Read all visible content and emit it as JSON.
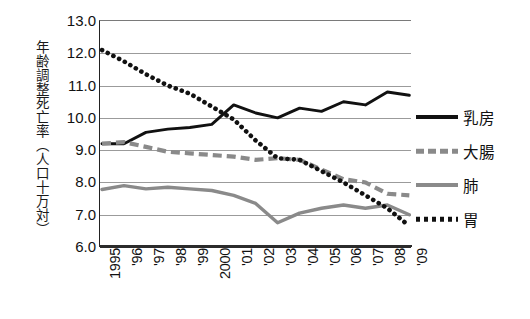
{
  "chart_data": {
    "type": "line",
    "title": "",
    "xlabel": "",
    "ylabel": "年齢調整死亡率（人口十万対）",
    "ylim": [
      6.0,
      13.0
    ],
    "ytick_labels": [
      "13.0",
      "12.0",
      "11.0",
      "10.0",
      "9.0",
      "8.0",
      "7.0",
      "6.0"
    ],
    "yticks": [
      13.0,
      12.0,
      11.0,
      10.0,
      9.0,
      8.0,
      7.0,
      6.0
    ],
    "grid": true,
    "legend_position": "right",
    "categories": [
      "1995",
      "'96",
      "'97",
      "'98",
      "'99",
      "2000",
      "'01",
      "'02",
      "'03",
      "'04",
      "'05",
      "'06",
      "'07",
      "'08",
      "'09"
    ],
    "series": [
      {
        "name": "乳房",
        "style": "solid",
        "color": "#111111",
        "values": [
          9.2,
          9.2,
          9.55,
          9.65,
          9.7,
          9.8,
          10.4,
          10.15,
          10.0,
          10.3,
          10.2,
          10.5,
          10.4,
          10.8,
          10.7
        ]
      },
      {
        "name": "大腸",
        "style": "dashed",
        "color": "#8a8a8a",
        "values": [
          9.2,
          9.25,
          9.1,
          8.95,
          8.9,
          8.85,
          8.8,
          8.7,
          8.75,
          8.7,
          8.4,
          8.1,
          8.0,
          7.65,
          7.6
        ]
      },
      {
        "name": "肺",
        "style": "solid",
        "color": "#8a8a8a",
        "values": [
          7.78,
          7.9,
          7.8,
          7.85,
          7.8,
          7.75,
          7.6,
          7.35,
          6.75,
          7.05,
          7.2,
          7.3,
          7.2,
          7.3,
          7.0
        ]
      },
      {
        "name": "胃",
        "style": "dotted",
        "color": "#111111",
        "values": [
          12.1,
          11.75,
          11.35,
          11.0,
          10.75,
          10.35,
          9.95,
          9.3,
          8.75,
          8.7,
          8.35,
          8.0,
          7.6,
          7.2,
          6.65
        ]
      }
    ]
  },
  "legend": {
    "items": [
      {
        "label": "乳房",
        "key": "solid-black"
      },
      {
        "label": "大腸",
        "key": "dash-gray"
      },
      {
        "label": "肺",
        "key": "solid-gray"
      },
      {
        "label": "胃",
        "key": "dot-black"
      }
    ]
  }
}
